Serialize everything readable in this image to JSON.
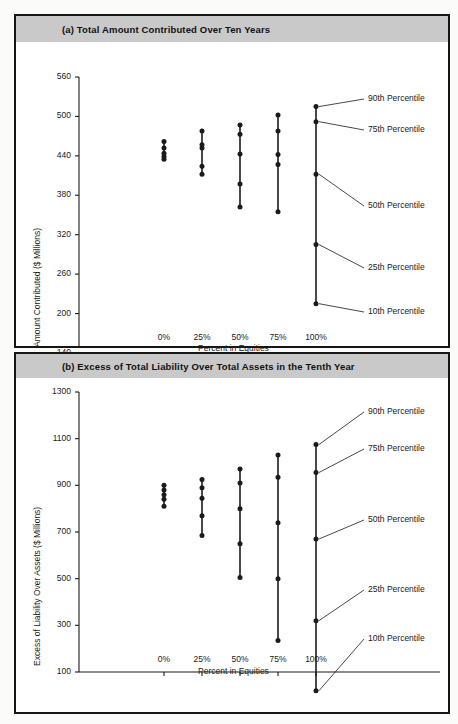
{
  "page": {
    "background": "#fbfbfa",
    "frame_color": "#161616",
    "band_color": "#c9c9c9",
    "ink_color": "#1b1b1b"
  },
  "panel_a": {
    "band_label": "(a)  Total Amount Contributed Over Ten Years"
  },
  "panel_b": {
    "band_label": "(b)  Excess of Total Liability Over Total Assets in the Tenth Year"
  },
  "chart_data": [
    {
      "id": "chart-a",
      "type": "scatter",
      "title": "(a)  Total Amount Contributed Over Ten Years",
      "xlabel": "Percent in Equities",
      "ylabel": "Amount Contributed ($ Millions)",
      "categories": [
        "0%",
        "25%",
        "50%",
        "75%",
        "100%"
      ],
      "xticklabels": [
        "0%",
        "25%",
        "50%",
        "75%",
        "100%"
      ],
      "yticklabels": [
        "140",
        "200",
        "260",
        "320",
        "380",
        "440",
        "500",
        "560"
      ],
      "ylim": [
        140,
        560
      ],
      "ytick_step": 60,
      "grid": false,
      "legend_position": "right-annotations",
      "series": [
        {
          "name": "90th Percentile",
          "values": [
            462,
            478,
            487,
            502,
            515
          ]
        },
        {
          "name": "75th Percentile",
          "values": [
            452,
            457,
            473,
            478,
            492
          ]
        },
        {
          "name": "50th Percentile",
          "values": [
            444,
            452,
            443,
            442,
            412
          ]
        },
        {
          "name": "25th Percentile",
          "values": [
            439,
            424,
            397,
            427,
            305
          ]
        },
        {
          "name": "10th Percentile",
          "values": [
            435,
            412,
            362,
            355,
            215
          ]
        }
      ],
      "annotations": [
        {
          "label": "90th Percentile",
          "points_to": {
            "x": "100%",
            "y": 515
          }
        },
        {
          "label": "75th Percentile",
          "points_to": {
            "x": "100%",
            "y": 492
          }
        },
        {
          "label": "50th Percentile",
          "points_to": {
            "x": "100%",
            "y": 412
          }
        },
        {
          "label": "25th Percentile",
          "points_to": {
            "x": "100%",
            "y": 305
          }
        },
        {
          "label": "10th Percentile",
          "points_to": {
            "x": "100%",
            "y": 215
          }
        }
      ]
    },
    {
      "id": "chart-b",
      "type": "scatter",
      "title": "(b)  Excess of Total Liability Over Total Assets in the Tenth Year",
      "xlabel": "Percent in Equities",
      "ylabel": "Excess of Liability Over Assets ($ Millions)",
      "categories": [
        "0%",
        "25%",
        "50%",
        "75%",
        "100%"
      ],
      "xticklabels": [
        "0%",
        "25%",
        "50%",
        "75%",
        "100%"
      ],
      "yticklabels": [
        "100",
        "300",
        "500",
        "700",
        "900",
        "1100",
        "1300"
      ],
      "ylim": [
        0,
        1300
      ],
      "ytick_step": 200,
      "grid": false,
      "legend_position": "right-annotations",
      "series": [
        {
          "name": "90th Percentile",
          "values": [
            900,
            925,
            970,
            1030,
            1075
          ]
        },
        {
          "name": "75th Percentile",
          "values": [
            880,
            890,
            910,
            935,
            955
          ]
        },
        {
          "name": "50th Percentile",
          "values": [
            860,
            845,
            800,
            740,
            670
          ]
        },
        {
          "name": "25th Percentile",
          "values": [
            840,
            770,
            650,
            500,
            320
          ]
        },
        {
          "name": "10th Percentile",
          "values": [
            810,
            685,
            505,
            235,
            20
          ]
        }
      ],
      "annotations": [
        {
          "label": "90th Percentile",
          "points_to": {
            "x": "100%",
            "y": 1075
          }
        },
        {
          "label": "75th Percentile",
          "points_to": {
            "x": "100%",
            "y": 955
          }
        },
        {
          "label": "50th Percentile",
          "points_to": {
            "x": "100%",
            "y": 670
          }
        },
        {
          "label": "25th Percentile",
          "points_to": {
            "x": "100%",
            "y": 320
          }
        },
        {
          "label": "10th Percentile",
          "points_to": {
            "x": "100%",
            "y": 20
          }
        }
      ]
    }
  ]
}
